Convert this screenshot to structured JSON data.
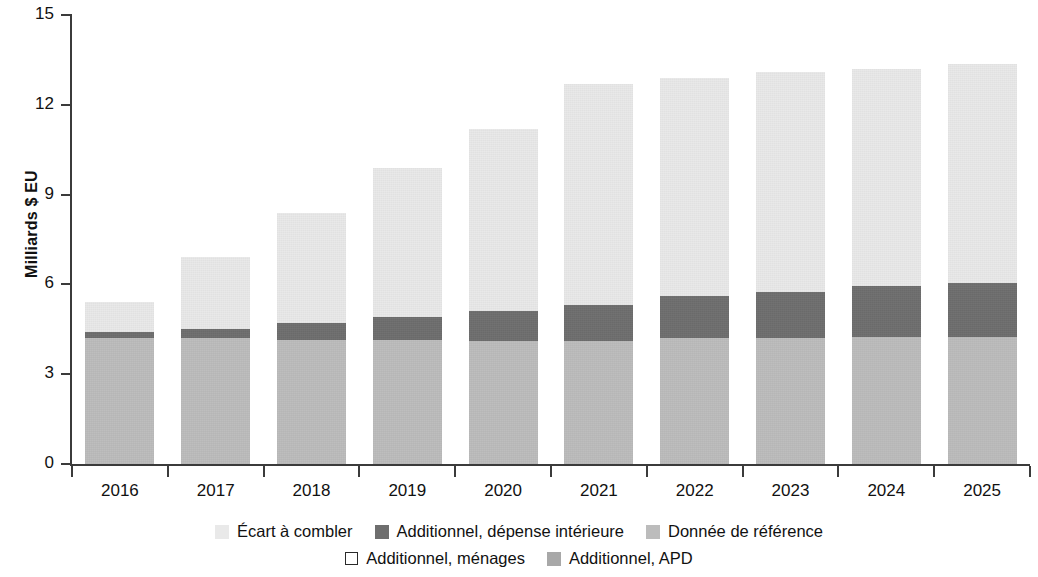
{
  "chart_data": {
    "type": "bar",
    "stacked": true,
    "title": "",
    "xlabel": "",
    "ylabel": "Milliards $ EU",
    "categories": [
      "2016",
      "2017",
      "2018",
      "2019",
      "2020",
      "2021",
      "2022",
      "2023",
      "2024",
      "2025"
    ],
    "ylim": [
      0,
      15
    ],
    "yticks": [
      0,
      3,
      6,
      9,
      12,
      15
    ],
    "ytick_labels": [
      "0",
      "3",
      "6",
      "9",
      "12",
      "15"
    ],
    "grid": false,
    "legend_position": "bottom",
    "series": [
      {
        "name": "Donnée de référence",
        "color": "#bcbcbc",
        "values": [
          4.2,
          4.2,
          4.15,
          4.15,
          4.1,
          4.1,
          4.2,
          4.2,
          4.25,
          4.25
        ]
      },
      {
        "name": "Additionnel, ménages",
        "color": "#ffffff",
        "values": [
          0,
          0,
          0,
          0,
          0,
          0,
          0,
          0,
          0,
          0
        ]
      },
      {
        "name": "Additionnel, APD",
        "color": "#a8a8a8",
        "values": [
          0,
          0,
          0,
          0,
          0,
          0,
          0,
          0,
          0,
          0
        ]
      },
      {
        "name": "Additionnel, dépense intérieure",
        "color": "#6e6e6e",
        "values": [
          0.2,
          0.3,
          0.55,
          0.75,
          1.0,
          1.2,
          1.4,
          1.55,
          1.7,
          1.8
        ]
      },
      {
        "name": "Écart à combler",
        "color": "#e9e9e9",
        "values": [
          1.0,
          2.4,
          3.7,
          5.0,
          6.1,
          7.4,
          7.3,
          7.35,
          7.25,
          7.3
        ]
      }
    ],
    "totals": [
      5.4,
      6.9,
      8.4,
      9.9,
      11.2,
      12.7,
      12.9,
      13.1,
      13.2,
      13.35
    ]
  },
  "axis": {
    "y_title": "Milliards $ EU"
  },
  "legend": {
    "rows": [
      [
        {
          "label": "Écart à combler",
          "swatch": "light-gray",
          "color": "#e9e9e9"
        },
        {
          "label": "Additionnel, dépense intérieure",
          "swatch": "dark-gray",
          "color": "#6e6e6e"
        },
        {
          "label": "Donnée de référence",
          "swatch": "mid-gray",
          "color": "#bcbcbc"
        }
      ],
      [
        {
          "label": "Additionnel, ménages",
          "swatch": "outline",
          "color": "#ffffff"
        },
        {
          "label": "Additionnel, APD",
          "swatch": "mid-dark-gray",
          "color": "#a8a8a8"
        }
      ]
    ]
  }
}
